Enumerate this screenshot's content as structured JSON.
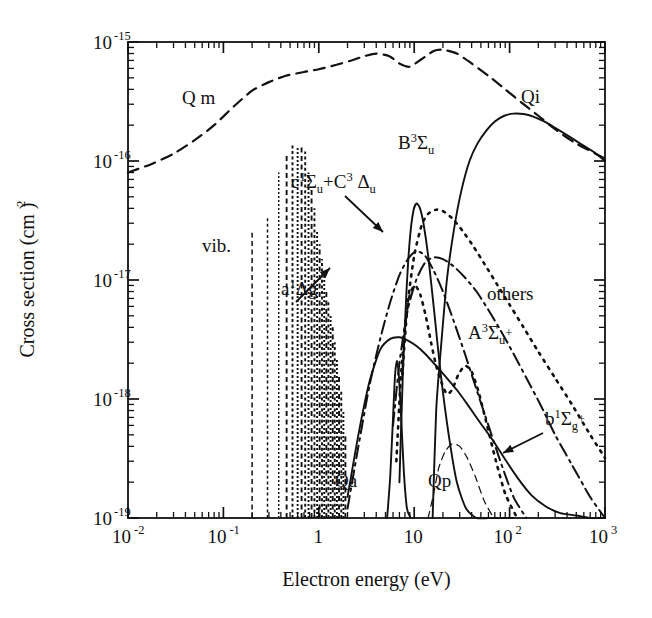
{
  "figure": {
    "background": "#ffffff",
    "ink": "#111111"
  },
  "axes": {
    "x_label": "Electron energy  (eV)",
    "y_label": "Cross section  (cm )",
    "y_label_unit_exp": "2",
    "x_ticks": [
      {
        "text": "10",
        "exp": "-2",
        "value": 0.01
      },
      {
        "text": "10",
        "exp": "-1",
        "value": 0.1
      },
      {
        "text": "1",
        "exp": "",
        "value": 1
      },
      {
        "text": "10",
        "exp": "",
        "value": 10
      },
      {
        "text": "10",
        "exp": "2",
        "value": 100
      },
      {
        "text": "10",
        "exp": "3",
        "value": 1000
      }
    ],
    "y_ticks": [
      {
        "text": "10",
        "exp": "-15",
        "value": 1e-15
      },
      {
        "text": "10",
        "exp": "-16",
        "value": 1e-16
      },
      {
        "text": "10",
        "exp": "-17",
        "value": 1e-17
      },
      {
        "text": "10",
        "exp": "-18",
        "value": 1e-18
      },
      {
        "text": "10",
        "exp": "-19",
        "value": 1e-19
      }
    ],
    "xlim": [
      0.01,
      1000
    ],
    "ylim": [
      1e-19,
      1e-15
    ],
    "xscale": "log",
    "yscale": "log",
    "grid": false,
    "frame": true
  },
  "annotations": [
    {
      "name": "qm-label",
      "x": 182,
      "y": 104,
      "parts": [
        {
          "t": "Q m",
          "k": "base"
        }
      ]
    },
    {
      "name": "qi-label",
      "x": 521,
      "y": 103,
      "parts": [
        {
          "t": "Qi",
          "k": "base"
        }
      ]
    },
    {
      "name": "b3sigmau-label",
      "x": 398,
      "y": 149,
      "parts": [
        {
          "t": "B",
          "k": "base"
        },
        {
          "t": "3",
          "k": "sup"
        },
        {
          "t": "Σ",
          "k": "base"
        },
        {
          "t": "u",
          "k": "sub"
        }
      ]
    },
    {
      "name": "c1sigmau-c3deltau-label",
      "x": 291,
      "y": 188,
      "parts": [
        {
          "t": "c",
          "k": "base"
        },
        {
          "t": "1",
          "k": "sup"
        },
        {
          "t": "Σ",
          "k": "base"
        },
        {
          "t": "u",
          "k": "sub"
        },
        {
          "t": "+C",
          "k": "base"
        },
        {
          "t": "3",
          "k": "sup"
        },
        {
          "t": " Δ",
          "k": "base"
        },
        {
          "t": "u",
          "k": "sub"
        }
      ]
    },
    {
      "name": "vib-label",
      "x": 202,
      "y": 252,
      "parts": [
        {
          "t": "vib.",
          "k": "base"
        }
      ]
    },
    {
      "name": "a1deltag-label",
      "x": 281,
      "y": 295,
      "parts": [
        {
          "t": "a",
          "k": "base"
        },
        {
          "t": "1",
          "k": "sup"
        },
        {
          "t": "Δg",
          "k": "base"
        }
      ]
    },
    {
      "name": "others-label",
      "x": 487,
      "y": 300,
      "parts": [
        {
          "t": "others",
          "k": "base"
        }
      ]
    },
    {
      "name": "a3sigmau-plus-label",
      "x": 468,
      "y": 339,
      "parts": [
        {
          "t": "A",
          "k": "base"
        },
        {
          "t": "3",
          "k": "sup"
        },
        {
          "t": "Σ",
          "k": "base"
        },
        {
          "t": "u",
          "k": "sub"
        },
        {
          "t": "+",
          "k": "supplus"
        }
      ]
    },
    {
      "name": "b1sigmag-plus-label",
      "x": 545,
      "y": 425,
      "parts": [
        {
          "t": "b",
          "k": "base"
        },
        {
          "t": "1",
          "k": "sup"
        },
        {
          "t": "Σ",
          "k": "base"
        },
        {
          "t": "g",
          "k": "sub"
        },
        {
          "t": "+",
          "k": "supplus"
        }
      ]
    },
    {
      "name": "qa-label",
      "x": 335,
      "y": 487,
      "parts": [
        {
          "t": "Qa",
          "k": "base"
        }
      ]
    },
    {
      "name": "qp-label",
      "x": 428,
      "y": 487,
      "parts": [
        {
          "t": "Qp",
          "k": "base"
        }
      ]
    }
  ],
  "chart_data": {
    "type": "line",
    "title": "",
    "xlabel": "Electron energy (eV)",
    "ylabel": "Cross section (cm^2)",
    "xscale": "log",
    "yscale": "log",
    "xlim": [
      0.01,
      1000
    ],
    "ylim": [
      1e-19,
      1e-15
    ],
    "grid": false,
    "legend": "inline-annotations",
    "series": [
      {
        "name": "Q m",
        "label": "Q m",
        "style": "dashed",
        "description": "momentum transfer cross section",
        "x": [
          0.01,
          0.018,
          0.03,
          0.05,
          0.08,
          0.13,
          0.2,
          0.3,
          0.45,
          0.7,
          1.0,
          1.5,
          2.2,
          3.0,
          4.0,
          5.5,
          7.0,
          9.0,
          12,
          16,
          20,
          28,
          40,
          60,
          90,
          140,
          200,
          300,
          500,
          1000
        ],
        "y": [
          8e-17,
          9.5e-17,
          1.15e-16,
          1.5e-16,
          2e-16,
          2.9e-16,
          3.9e-16,
          4.6e-16,
          5.2e-16,
          5.6e-16,
          5.9e-16,
          6.4e-16,
          7e-16,
          7.6e-16,
          8e-16,
          7.6e-16,
          6.6e-16,
          6.2e-16,
          7.2e-16,
          8.4e-16,
          8.6e-16,
          8e-16,
          6.6e-16,
          5.2e-16,
          4e-16,
          3e-16,
          2.4e-16,
          1.85e-16,
          1.4e-16,
          1.05e-16
        ]
      },
      {
        "name": "Qi",
        "label": "Qi",
        "style": "solid",
        "description": "total ionization cross section",
        "x": [
          15.6,
          17,
          19,
          22,
          26,
          31,
          38,
          46,
          57,
          70,
          88,
          110,
          140,
          180,
          230,
          300,
          400,
          550,
          750,
          1000
        ],
        "y": [
          1e-19,
          8e-19,
          2.6e-18,
          1e-17,
          2.6e-17,
          5.5e-17,
          1e-16,
          1.4e-16,
          1.8e-16,
          2.15e-16,
          2.4e-16,
          2.5e-16,
          2.48e-16,
          2.35e-16,
          2.15e-16,
          1.9e-16,
          1.65e-16,
          1.4e-16,
          1.2e-16,
          1e-16
        ]
      },
      {
        "name": "B 3 Sigma u",
        "label": "B3Σu",
        "style": "dotted",
        "description": "B3Σu electronic excitation",
        "x": [
          7.5,
          8.5,
          10,
          12,
          14,
          17,
          20,
          25,
          32,
          42,
          55,
          75,
          100,
          140,
          200,
          300,
          450,
          700,
          1000
        ],
        "y": [
          1.6e-18,
          6e-18,
          1.6e-17,
          2.9e-17,
          3.6e-17,
          3.9e-17,
          3.8e-17,
          3.3e-17,
          2.6e-17,
          1.9e-17,
          1.35e-17,
          9e-18,
          6.2e-18,
          4e-18,
          2.5e-18,
          1.5e-18,
          9e-19,
          5e-19,
          3.2e-19
        ]
      },
      {
        "name": "c 1 Sigma u + C 3 Delta u",
        "label": "c1Σu+C3Δu",
        "style": "solid",
        "description": "combined c1Σu and C3Δu excitation",
        "x": [
          7.0,
          7.6,
          8.3,
          9.0,
          9.8,
          10.6,
          11.5,
          12.5,
          14,
          16,
          19,
          23,
          28,
          35,
          45,
          60,
          80,
          110
        ],
        "y": [
          2e-19,
          1.6e-18,
          8e-18,
          2.2e-17,
          3.8e-17,
          4.4e-17,
          4e-17,
          3e-17,
          1.6e-17,
          6e-18,
          1.6e-18,
          5e-19,
          2e-19,
          1.2e-19,
          1e-19,
          1e-19,
          1e-19,
          1e-19
        ]
      },
      {
        "name": "a 1 Delta g",
        "label": "a1Δg",
        "style": "dash-dot",
        "description": "a1Δg metastable excitation",
        "x": [
          2.0,
          2.6,
          3.4,
          4.4,
          5.6,
          7.0,
          8.6,
          10.5,
          13,
          16,
          20,
          26,
          34,
          45,
          60,
          80,
          110,
          150
        ],
        "y": [
          1.2e-19,
          4e-19,
          1.3e-18,
          3.2e-18,
          6.5e-18,
          1.1e-17,
          1.5e-17,
          1.75e-17,
          1.6e-17,
          1.2e-17,
          8e-18,
          4.5e-18,
          2.4e-18,
          1.2e-18,
          6e-19,
          3e-19,
          1.5e-19,
          1e-19
        ]
      },
      {
        "name": "others",
        "label": "others",
        "style": "dash-dot",
        "description": "sum of other excitation channels",
        "x": [
          6.0,
          7.0,
          8.5,
          10.5,
          13,
          16,
          20,
          26,
          34,
          45,
          60,
          80,
          110,
          150,
          210,
          300,
          450,
          700,
          1000
        ],
        "y": [
          6e-19,
          2e-18,
          5.5e-18,
          1e-17,
          1.4e-17,
          1.55e-17,
          1.5e-17,
          1.3e-17,
          1.05e-17,
          8e-18,
          5.6e-18,
          3.8e-18,
          2.4e-18,
          1.5e-18,
          9e-19,
          5e-19,
          2.8e-19,
          1.5e-19,
          1e-19
        ]
      },
      {
        "name": "A 3 Sigma u +",
        "label": "A3Σu+",
        "style": "dotted",
        "description": "A3Σu+ triplet excitation",
        "x": [
          6.5,
          7.2,
          8.0,
          9.0,
          10.2,
          11.6,
          13.2,
          15,
          17,
          19.5,
          22,
          25,
          29,
          34,
          40,
          48,
          58,
          72,
          90,
          120
        ],
        "y": [
          3e-19,
          1.4e-18,
          4e-18,
          7.5e-18,
          9e-18,
          7.5e-18,
          5e-18,
          3e-18,
          1.9e-18,
          1.35e-18,
          1.1e-18,
          1.2e-18,
          1.6e-18,
          1.9e-18,
          1.7e-18,
          1.1e-18,
          6e-19,
          3e-19,
          1.6e-19,
          1e-19
        ]
      },
      {
        "name": "b 1 Sigma g +",
        "label": "b1Σg+",
        "style": "solid",
        "description": "b1Σg+ excitation / low-level tail",
        "x": [
          2.0,
          2.6,
          3.4,
          4.4,
          5.6,
          7.0,
          8.6,
          10.5,
          13,
          17,
          22,
          29,
          38,
          50,
          68,
          90,
          125,
          170,
          240,
          340,
          500,
          700,
          1000
        ],
        "y": [
          1.5e-19,
          5e-19,
          1.4e-18,
          2.6e-18,
          3.2e-18,
          3.3e-18,
          3.1e-18,
          2.8e-18,
          2.4e-18,
          1.9e-18,
          1.5e-18,
          1.15e-18,
          8.5e-19,
          6.2e-19,
          4.4e-19,
          3.1e-19,
          2.1e-19,
          1.55e-19,
          1.25e-19,
          1.1e-19,
          1.05e-19,
          1e-19,
          1e-19
        ]
      },
      {
        "name": "Qa",
        "label": "Qa",
        "style": "solid",
        "description": "attachment cross section, narrow resonance near 6.5 eV",
        "x": [
          5.2,
          5.6,
          6.0,
          6.3,
          6.6,
          6.9,
          7.3,
          7.8,
          8.4,
          9.2
        ],
        "y": [
          1e-19,
          2.2e-19,
          7e-19,
          1.6e-18,
          2.1e-18,
          1.6e-18,
          7e-19,
          2.4e-19,
          1.2e-19,
          1e-19
        ]
      },
      {
        "name": "Qp",
        "label": "Qp",
        "style": "dashed-thin",
        "description": "dissociation into neutrals / polar products",
        "x": [
          14,
          16,
          18,
          21,
          25,
          30,
          36,
          44,
          54,
          68
        ],
        "y": [
          1e-19,
          1.6e-19,
          2.6e-19,
          3.6e-19,
          4.2e-19,
          4e-19,
          3.2e-19,
          2.2e-19,
          1.4e-19,
          1e-19
        ]
      },
      {
        "name": "vib.",
        "label": "vib.",
        "style": "vertical-lines",
        "description": "vibrational excitation resonance peaks, discrete energies",
        "peaks": [
          {
            "x": 0.2,
            "y": 2.5e-17
          },
          {
            "x": 0.29,
            "y": 3.4e-17
          },
          {
            "x": 0.38,
            "y": 8e-17
          },
          {
            "x": 0.46,
            "y": 1.1e-16
          },
          {
            "x": 0.53,
            "y": 1.35e-16
          },
          {
            "x": 0.6,
            "y": 1.3e-16
          },
          {
            "x": 0.66,
            "y": 1.35e-16
          },
          {
            "x": 0.72,
            "y": 1.2e-16
          },
          {
            "x": 0.78,
            "y": 8e-17
          },
          {
            "x": 0.84,
            "y": 6e-17
          },
          {
            "x": 0.9,
            "y": 4e-17
          },
          {
            "x": 0.96,
            "y": 2.6e-17
          },
          {
            "x": 1.02,
            "y": 2e-17
          },
          {
            "x": 1.08,
            "y": 1.5e-17
          },
          {
            "x": 1.14,
            "y": 1.1e-17
          },
          {
            "x": 1.2,
            "y": 8.5e-18
          },
          {
            "x": 1.26,
            "y": 6.5e-18
          },
          {
            "x": 1.33,
            "y": 5e-18
          },
          {
            "x": 1.4,
            "y": 4e-18
          },
          {
            "x": 1.47,
            "y": 3e-18
          },
          {
            "x": 1.55,
            "y": 2.2e-18
          },
          {
            "x": 1.63,
            "y": 1.6e-18
          },
          {
            "x": 1.72,
            "y": 1.2e-18
          },
          {
            "x": 1.81,
            "y": 8e-19
          },
          {
            "x": 1.9,
            "y": 5e-19
          }
        ]
      }
    ]
  }
}
